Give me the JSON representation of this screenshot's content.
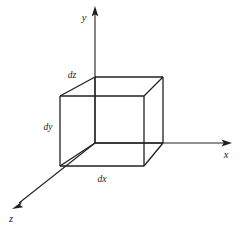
{
  "figure": {
    "background_color": "#ffffff",
    "stroke_color": "#231f20",
    "text_color": "#1a1a1a",
    "width": 243,
    "height": 227
  },
  "axes": {
    "origin": {
      "x": 95,
      "y": 143
    },
    "items": [
      {
        "name": "y-axis",
        "label": "y",
        "direction": "up",
        "label_x": 84,
        "label_y": 19,
        "line": {
          "x1": 95,
          "y1": 143,
          "x2": 95,
          "y2": 12
        },
        "arrow": {
          "tip_x": 95,
          "tip_y": 7,
          "angle_deg": -90
        },
        "stroke_width": 1.1
      },
      {
        "name": "x-axis",
        "label": "x",
        "direction": "right",
        "label_x": 226,
        "label_y": 155,
        "line": {
          "x1": 95,
          "y1": 143,
          "x2": 225,
          "y2": 143
        },
        "arrow": {
          "tip_x": 231,
          "tip_y": 143,
          "angle_deg": 0
        },
        "stroke_width": 1.1
      },
      {
        "name": "z-axis",
        "label": "z",
        "direction": "down-left",
        "label_x": 11,
        "label_y": 219,
        "line": {
          "x1": 95,
          "y1": 143,
          "x2": 18,
          "y2": 204
        },
        "arrow": {
          "tip_x": 12,
          "tip_y": 209,
          "angle_deg": 141.7
        },
        "stroke_width": 1.1
      }
    ]
  },
  "cube": {
    "name": "differential volume element",
    "stroke_width": 1.3,
    "vertices": {
      "back_bottom_left": {
        "x": 95,
        "y": 143
      },
      "back_bottom_right": {
        "x": 163,
        "y": 143
      },
      "back_top_left": {
        "x": 95,
        "y": 77
      },
      "back_top_right": {
        "x": 163,
        "y": 77
      },
      "front_bottom_left": {
        "x": 60,
        "y": 166
      },
      "front_bottom_right": {
        "x": 144,
        "y": 166
      },
      "front_top_left": {
        "x": 60,
        "y": 96
      },
      "front_top_right": {
        "x": 144,
        "y": 96
      }
    },
    "edges": [
      {
        "name": "back-top",
        "from": "back_top_left",
        "to": "back_top_right"
      },
      {
        "name": "back-bottom",
        "from": "back_bottom_left",
        "to": "back_bottom_right"
      },
      {
        "name": "back-left-vertical",
        "from": "back_top_left",
        "to": "back_bottom_left"
      },
      {
        "name": "back-right-vertical",
        "from": "back_top_right",
        "to": "back_bottom_right"
      },
      {
        "name": "front-top",
        "from": "front_top_left",
        "to": "front_top_right"
      },
      {
        "name": "front-bottom",
        "from": "front_bottom_left",
        "to": "front_bottom_right"
      },
      {
        "name": "front-left-vertical",
        "from": "front_top_left",
        "to": "front_bottom_left"
      },
      {
        "name": "front-right-vertical",
        "from": "front_top_right",
        "to": "front_bottom_right"
      },
      {
        "name": "depth-top-left",
        "from": "front_top_left",
        "to": "back_top_left"
      },
      {
        "name": "depth-top-right",
        "from": "front_top_right",
        "to": "back_top_right"
      },
      {
        "name": "depth-bottom-left",
        "from": "front_bottom_left",
        "to": "back_bottom_left"
      },
      {
        "name": "depth-bottom-right",
        "from": "front_bottom_right",
        "to": "back_bottom_right"
      }
    ]
  },
  "dimension_labels": [
    {
      "name": "dz-label",
      "text": "dz",
      "x": 72,
      "y": 76,
      "edge": "depth-top-left"
    },
    {
      "name": "dy-label",
      "text": "dy",
      "x": 48,
      "y": 128,
      "edge": "front-left-vertical"
    },
    {
      "name": "dx-label",
      "text": "dx",
      "x": 102,
      "y": 179,
      "edge": "front-bottom"
    }
  ]
}
